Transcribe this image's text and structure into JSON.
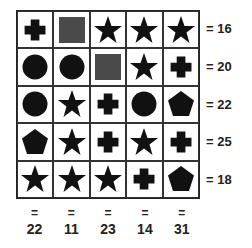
{
  "puzzle": {
    "grid": [
      [
        "cross",
        "square",
        "star",
        "star",
        "star"
      ],
      [
        "circle",
        "circle",
        "square",
        "star",
        "cross"
      ],
      [
        "circle",
        "star",
        "cross",
        "circle",
        "pentagon"
      ],
      [
        "pentagon",
        "star",
        "cross",
        "star",
        "cross"
      ],
      [
        "star",
        "star",
        "star",
        "cross",
        "pentagon"
      ]
    ],
    "row_sums": [
      "= 16",
      "= 20",
      "= 22",
      "= 25",
      "= 18"
    ],
    "col_sums": [
      "22",
      "11",
      "23",
      "14",
      "31"
    ],
    "equals": "=",
    "colors": {
      "shape": "#111111",
      "square": "#4a4a4a"
    }
  }
}
